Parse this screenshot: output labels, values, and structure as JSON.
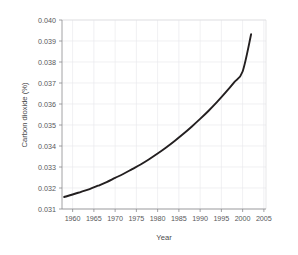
{
  "chart_data": {
    "type": "line",
    "title": "",
    "xlabel": "Year",
    "ylabel": "Carbon dioxide (%)",
    "xlim": [
      1957.5,
      2005.5
    ],
    "ylim": [
      0.031,
      0.04
    ],
    "grid": true,
    "legend": "none",
    "xticks": [
      1960,
      1965,
      1970,
      1975,
      1980,
      1985,
      1990,
      1995,
      2000,
      2005
    ],
    "xtick_labels": [
      "1960",
      "1965",
      "1970",
      "1975",
      "1980",
      "1985",
      "1990",
      "1995",
      "2000",
      "2005"
    ],
    "yticks": [
      0.031,
      0.032,
      0.033,
      0.034,
      0.035,
      0.036,
      0.037,
      0.038,
      0.039,
      0.04
    ],
    "ytick_labels": [
      "0.031",
      "0.032",
      "0.033",
      "0.034",
      "0.035",
      "0.036",
      "0.037",
      "0.038",
      "0.039",
      "0.040"
    ],
    "series": [
      {
        "name": "Carbon dioxide",
        "color": "#231f20",
        "x": [
          1958,
          1960,
          1962,
          1964,
          1966,
          1968,
          1970,
          1972,
          1974,
          1976,
          1978,
          1980,
          1982,
          1984,
          1986,
          1988,
          1990,
          1992,
          1994,
          1996,
          1998,
          2000,
          2002
        ],
        "values": [
          0.03157,
          0.03169,
          0.03182,
          0.03195,
          0.03211,
          0.03228,
          0.03248,
          0.03268,
          0.0329,
          0.03312,
          0.03337,
          0.03364,
          0.03393,
          0.03424,
          0.03457,
          0.03492,
          0.03529,
          0.03568,
          0.0361,
          0.03655,
          0.03703,
          0.03755,
          0.03932
        ]
      }
    ]
  },
  "axis_titles": {
    "x": "Year",
    "y": "Carbon dioxide (%)"
  }
}
